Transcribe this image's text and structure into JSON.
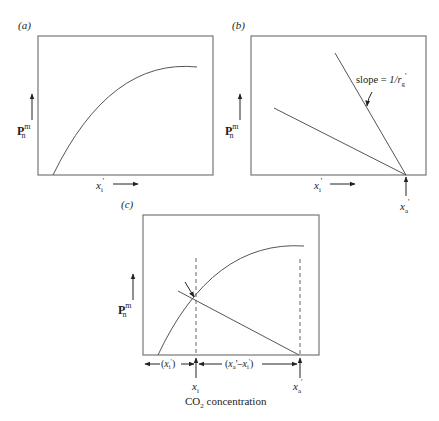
{
  "panels": {
    "a": {
      "label": "(a)",
      "y_axis": {
        "symbol": "P",
        "sup": "m",
        "sub": "n"
      },
      "x_axis": {
        "symbol": "x",
        "sub": "i",
        "prime": "'"
      },
      "curve": "saturating-response"
    },
    "b": {
      "label": "(b)",
      "y_axis": {
        "symbol": "P",
        "sup": "m",
        "sub": "n"
      },
      "x_axis": {
        "symbol": "x",
        "sub": "i",
        "prime": "'"
      },
      "annotation": {
        "text_prefix": "slope = ",
        "text_main": "1/r",
        "text_sub": "g",
        "text_prime": "'"
      },
      "x_marker": {
        "symbol": "x",
        "sub": "a",
        "prime": "'"
      }
    },
    "c": {
      "label": "(c)",
      "y_axis": {
        "symbol": "P",
        "sup": "m",
        "sub": "n"
      },
      "dim_left": "(xᵢ')",
      "dim_left_parts": {
        "open": "(",
        "symbol": "x",
        "sub": "i",
        "prime": "'",
        "close": ")"
      },
      "dim_right_parts": {
        "open": "(",
        "s1": "x",
        "sub1": "a",
        "mid": "'–",
        "s2": "x",
        "sub2": "i",
        "prime": "'",
        "close": ")"
      },
      "x_marker_i": {
        "symbol": "x",
        "sub": "i"
      },
      "x_marker_a": {
        "symbol": "x",
        "sub": "a",
        "prime": "'"
      },
      "x_title": {
        "pre": "CO",
        "sub": "2",
        "post": " concentration"
      }
    }
  },
  "colors": {
    "line": "#555555",
    "frame": "#777777",
    "text": "#222222"
  }
}
